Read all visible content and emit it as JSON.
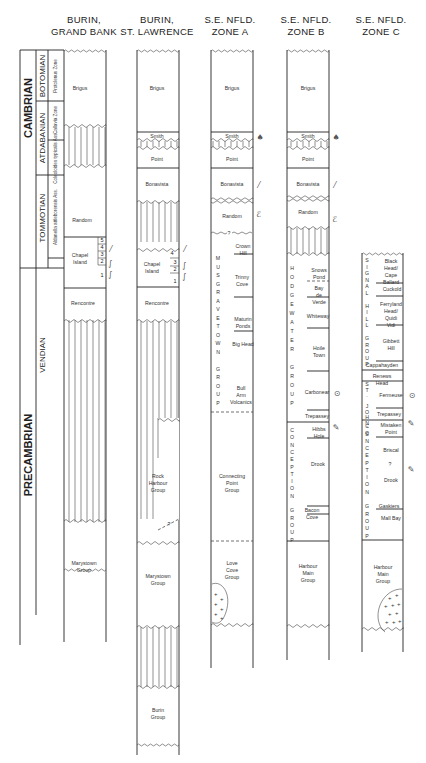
{
  "timescale": {
    "eras": [
      {
        "label": "CAMBRIAN",
        "top": 0,
        "bottom": 0.37
      },
      {
        "label": "PRECAMBRIAN",
        "top": 0.37,
        "bottom": 1.0
      }
    ],
    "stages": [
      {
        "label": "BOTOMIAN"
      },
      {
        "label": "ATDABANIAN"
      },
      {
        "label": "TOMMOTIAN"
      },
      {
        "label": "VENDIAN"
      }
    ],
    "zones": [
      {
        "label": "Protolenus Zone"
      },
      {
        "label": "Callavia Zone"
      },
      {
        "label": "Coleoloides typicalis Ass."
      },
      {
        "label": "Aldanella attleborensis Ass."
      }
    ]
  },
  "columns": [
    {
      "header_line1": "BURIN,",
      "header_line2": "GRAND BANK",
      "units": [
        {
          "label": "Brigus"
        },
        {
          "label": "Random"
        },
        {
          "label": "Chapel Island"
        },
        {
          "label": "Rencontre"
        },
        {
          "label": "Marystown Group"
        }
      ],
      "chapel_members": [
        "5",
        "4",
        "3",
        "2",
        "1"
      ]
    },
    {
      "header_line1": "BURIN,",
      "header_line2": "ST. LAWRENCE",
      "units": [
        {
          "label": "Brigus"
        },
        {
          "label": "Smith"
        },
        {
          "label": "Point"
        },
        {
          "label": "Bonavista"
        },
        {
          "label": "Chapel Island"
        },
        {
          "label": "Rencontre"
        },
        {
          "label": "Rock Harbour Group"
        },
        {
          "label": "Marystown Group"
        },
        {
          "label": "Burin Group"
        }
      ],
      "chapel_members": [
        "4",
        "3",
        "2",
        "1"
      ],
      "query_mark": "?"
    },
    {
      "header_line1": "S.E. NFLD.",
      "header_line2": "ZONE A",
      "units": [
        {
          "label": "Brigus"
        },
        {
          "label": "Smith"
        },
        {
          "label": "Point"
        },
        {
          "label": "Bonavista"
        },
        {
          "label": "Random"
        },
        {
          "label": "Crown Hill"
        },
        {
          "label": "Trinny Cove"
        },
        {
          "label": "Maturin Ponds"
        },
        {
          "label": "Big Head"
        },
        {
          "label": "Bull Arm Volcanics"
        },
        {
          "label": "Connecting Point Group"
        },
        {
          "label": "Love Cove Group"
        }
      ],
      "group_vertical": "MUSGRAVETOWN GROUP",
      "query_mark": "?"
    },
    {
      "header_line1": "S.E. NFLD.",
      "header_line2": "ZONE B",
      "units": [
        {
          "label": "Brigus"
        },
        {
          "label": "Smith"
        },
        {
          "label": "Point"
        },
        {
          "label": "Bonavista"
        },
        {
          "label": "Random"
        },
        {
          "label": "Snows Pond"
        },
        {
          "label": "Bay de Verde"
        },
        {
          "label": "Whiteway"
        },
        {
          "label": "Hoile Town"
        },
        {
          "label": "Carbonear"
        },
        {
          "label": "Trepassey"
        },
        {
          "label": "Hibbs Hole"
        },
        {
          "label": "Drook"
        },
        {
          "label": "Bacon Cove"
        },
        {
          "label": "Harbour Main Group"
        }
      ],
      "group_vertical_1": "HODGEWATER GROUP",
      "group_vertical_2": "CONCEPTION GROUP"
    },
    {
      "header_line1": "S.E. NFLD.",
      "header_line2": "ZONE C",
      "units": [
        {
          "label": "Black Head/ Cape Ballard"
        },
        {
          "label": "Cuckold"
        },
        {
          "label": "Ferryland Head/ Quidi Vidi"
        },
        {
          "label": "Gibbett Hill"
        },
        {
          "label": "Cappahayden"
        },
        {
          "label": "Renews Head"
        },
        {
          "label": "Fermeuse"
        },
        {
          "label": "Trepassey"
        },
        {
          "label": "Mistaken Point"
        },
        {
          "label": "Briscal"
        },
        {
          "label": "Drook"
        },
        {
          "label": "Gaskiers"
        },
        {
          "label": "Mall Bay"
        },
        {
          "label": "Harbour Main Group"
        }
      ],
      "group_vertical_1": "SIGNAL HILL GROUP",
      "group_vertical_2": "ST. JOHN'S GR.",
      "group_vertical_3": "CONCEPTION GROUP",
      "query_mark": "?"
    }
  ],
  "symbols": {
    "trace_fossil": "burrow-icon",
    "shelly_fossil": "shell-icon",
    "soft_body": "ediacara-icon",
    "trilobite": "trilobite-icon",
    "glacial": "tillite-icon"
  }
}
